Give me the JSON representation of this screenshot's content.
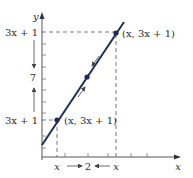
{
  "figure": {
    "type": "limit-illustration",
    "axes": {
      "x_label": "x",
      "y_label": "y"
    },
    "line": {
      "equation": "y = 3x + 1",
      "color": "#1f2a5a"
    },
    "points": [
      {
        "label": "(x, 3x + 1)",
        "position": "lower"
      },
      {
        "label": "",
        "position": "center",
        "value": "(2, 7)"
      },
      {
        "label": "(x, 3x + 1)",
        "position": "upper"
      }
    ],
    "y_axis_labels": {
      "top": "3x + 1",
      "middle": "7",
      "bottom": "3x + 1"
    },
    "x_axis_labels": {
      "left": "x",
      "middle": "2",
      "right": "x",
      "axis_end": "x"
    },
    "colors": {
      "line": "#1f2a5a",
      "axis": "#555555",
      "dashed": "#555555",
      "text": "#2a2a2a"
    }
  }
}
